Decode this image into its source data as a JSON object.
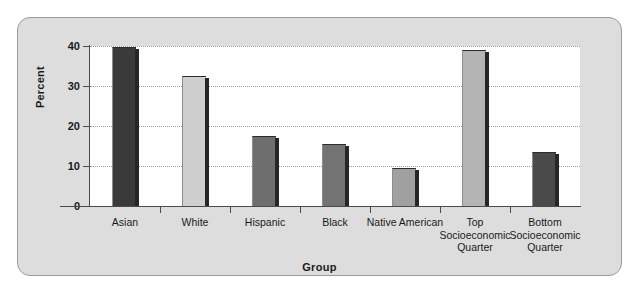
{
  "chart_data": {
    "type": "bar",
    "title": "",
    "xlabel": "Group",
    "ylabel": "Percent",
    "categories": [
      "Asian",
      "White",
      "Hispanic",
      "Black",
      "Native American",
      "Top\nSocioeconomic\nQuarter",
      "Bottom\nSocioeconomic\nQuarter"
    ],
    "values": [
      39.5,
      32.3,
      17.2,
      15.2,
      9.2,
      38.8,
      13.2
    ],
    "bar_colors": [
      "#3a3a3a",
      "#cfcfcf",
      "#6e6e6e",
      "#737373",
      "#a0a0a0",
      "#b4b4b4",
      "#4a4a4a"
    ],
    "ylim": [
      0,
      40
    ],
    "yticks": [
      0,
      10,
      20,
      30,
      40
    ],
    "ytick_labels": [
      "0",
      "10",
      "20",
      "30",
      "40"
    ],
    "grid": true,
    "grid_axis": "y",
    "legend": "none",
    "panel_background": "#dddddd",
    "plot_background": "#ffffff"
  },
  "axis": {
    "y_title": "Percent",
    "x_title": "Group"
  }
}
